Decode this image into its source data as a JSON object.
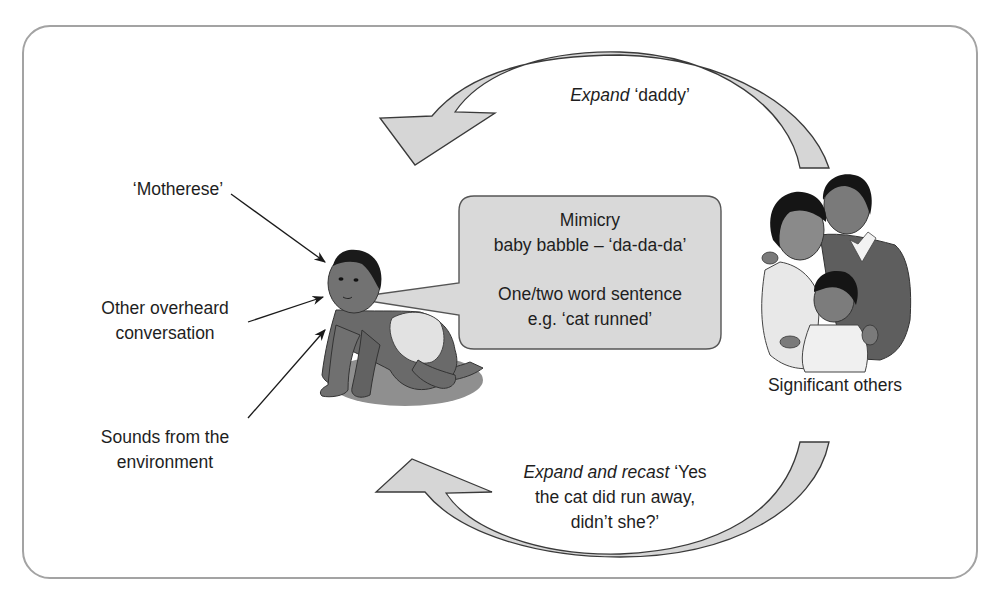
{
  "diagram": {
    "type": "language-acquisition-cycle",
    "colors": {
      "frame_border": "#a3a3a3",
      "arrow_fill": "#d6d6d6",
      "arrow_stroke": "#3a3a3a",
      "bubble_fill": "#d9d9d9",
      "bubble_stroke": "#555555",
      "text": "#1e1e1e"
    },
    "inputs": [
      {
        "id": "motherese",
        "lines": [
          "‘Motherese’"
        ]
      },
      {
        "id": "overheard",
        "lines": [
          "Other overheard",
          "conversation"
        ]
      },
      {
        "id": "environment",
        "lines": [
          "Sounds from the",
          "environment"
        ]
      }
    ],
    "child": {
      "illustration": "crawling-baby-icon"
    },
    "speech_bubble": {
      "block1": [
        "Mimicry",
        "baby babble – ‘da-da-da’"
      ],
      "block2": [
        "One/two word sentence",
        "e.g. ‘cat runned’"
      ]
    },
    "others": {
      "illustration": "family-group-icon",
      "label": "Significant others"
    },
    "top_arrow": {
      "direction": "right-to-left",
      "label_italic": "Expand",
      "label_rest": " ‘daddy’"
    },
    "bottom_arrow": {
      "direction": "right-to-left",
      "label_italic": "Expand and recast",
      "label_rest_line1": " ‘Yes",
      "line2": "the cat did run away,",
      "line3": "didn’t she?’"
    }
  }
}
